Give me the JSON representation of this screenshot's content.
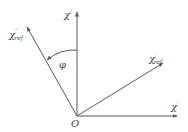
{
  "diagram": {
    "title": "",
    "colors": {
      "line": "#5a5a5a",
      "text": "#444444",
      "background": "#ffffff"
    },
    "origin": {
      "label": "O",
      "x": 77,
      "y": 116
    },
    "axes": [
      {
        "id": "chi-double-prime",
        "label": "χ",
        "superscript": "″",
        "subscript": "",
        "tip": [
          77,
          12
        ],
        "label_pos": [
          64,
          18
        ]
      },
      {
        "id": "chi-prime",
        "label": "χ",
        "superscript": "′",
        "subscript": "",
        "tip": [
          177,
          116
        ],
        "label_pos": [
          171,
          110
        ]
      }
    ],
    "rays": [
      {
        "id": "chi-double-prime-ref",
        "label": "χ",
        "superscript": "″",
        "subscript": "ref",
        "tip": [
          27,
          27
        ],
        "label_pos": [
          9,
          38
        ]
      },
      {
        "id": "chi-prime-ref",
        "label": "χ",
        "superscript": "′",
        "subscript": "ref",
        "tip": [
          163,
          63
        ],
        "label_pos": [
          149,
          62
        ]
      }
    ],
    "angle": {
      "label": "φ",
      "from": [
        77,
        50
      ],
      "to": [
        47,
        60
      ],
      "label_pos": [
        59,
        68
      ]
    }
  }
}
